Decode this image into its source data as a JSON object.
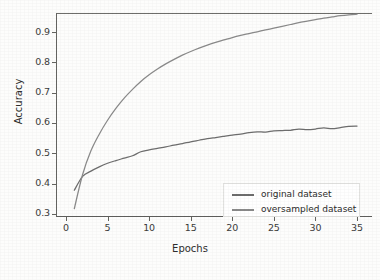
{
  "chart_data": {
    "type": "line",
    "title": "",
    "xlabel": "Epochs",
    "ylabel": "Accuracy",
    "xlim": [
      -1.2,
      36.8
    ],
    "ylim": [
      0.293,
      0.963
    ],
    "grid": false,
    "legend_position": "lower right",
    "xticks": [
      0,
      5,
      10,
      15,
      20,
      25,
      30,
      35
    ],
    "xtick_labels": [
      "0",
      "5",
      "10",
      "15",
      "20",
      "25",
      "30",
      "35"
    ],
    "yticks": [
      0.3,
      0.4,
      0.5,
      0.6,
      0.7,
      0.8,
      0.9
    ],
    "ytick_labels": [
      "0.3",
      "0.4",
      "0.5",
      "0.6",
      "0.7",
      "0.8",
      "0.9"
    ],
    "x": [
      1,
      2,
      3,
      4,
      5,
      6,
      7,
      8,
      9,
      10,
      11,
      12,
      13,
      14,
      15,
      16,
      17,
      18,
      19,
      20,
      21,
      22,
      23,
      24,
      25,
      26,
      27,
      28,
      29,
      30,
      31,
      32,
      33,
      34,
      35
    ],
    "series": [
      {
        "name": "original dataset",
        "color": "#6e6e6e",
        "values": [
          0.378,
          0.424,
          0.441,
          0.455,
          0.467,
          0.476,
          0.484,
          0.492,
          0.505,
          0.511,
          0.516,
          0.521,
          0.527,
          0.532,
          0.538,
          0.543,
          0.548,
          0.552,
          0.556,
          0.56,
          0.563,
          0.568,
          0.571,
          0.57,
          0.574,
          0.575,
          0.576,
          0.58,
          0.578,
          0.58,
          0.584,
          0.581,
          0.585,
          0.589,
          0.59
        ]
      },
      {
        "name": "oversampled dataset",
        "color": "#8a8a8a",
        "values": [
          0.317,
          0.43,
          0.508,
          0.563,
          0.609,
          0.648,
          0.682,
          0.711,
          0.737,
          0.759,
          0.778,
          0.795,
          0.81,
          0.824,
          0.836,
          0.847,
          0.857,
          0.866,
          0.874,
          0.882,
          0.889,
          0.895,
          0.901,
          0.907,
          0.913,
          0.919,
          0.925,
          0.931,
          0.936,
          0.941,
          0.946,
          0.95,
          0.954,
          0.957,
          0.959
        ]
      }
    ]
  },
  "legend": {
    "entries": [
      {
        "label": "original dataset",
        "color": "#6e6e6e"
      },
      {
        "label": "oversampled dataset",
        "color": "#8a8a8a"
      }
    ]
  },
  "axes": {
    "x_title": "Epochs",
    "y_title": "Accuracy",
    "x_tick_labels": [
      "0",
      "5",
      "10",
      "15",
      "20",
      "25",
      "30",
      "35"
    ],
    "y_tick_labels": [
      "0.3",
      "0.4",
      "0.5",
      "0.6",
      "0.7",
      "0.8",
      "0.9"
    ]
  },
  "style": {
    "axis_color": "#64645f",
    "text_color": "#2e2e2d",
    "background": "#fdfdfc",
    "legend_border": "#e2e2e0"
  }
}
